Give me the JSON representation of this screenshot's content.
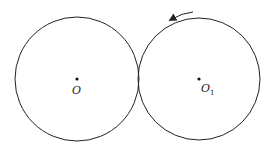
{
  "diagram": {
    "circles": [
      {
        "name": "O",
        "cx": 77,
        "cy": 79,
        "r": 62
      },
      {
        "name": "O1",
        "cx": 199,
        "cy": 79,
        "r": 61
      }
    ],
    "labels": {
      "left_center": "O",
      "right_center_main": "O",
      "right_center_sub": "1"
    },
    "arrow": {
      "direction": "counterclockwise",
      "from": [
        193,
        12
      ],
      "to": [
        170,
        20
      ]
    },
    "colors": {
      "stroke": "#222222",
      "background": "#ffffff"
    }
  }
}
